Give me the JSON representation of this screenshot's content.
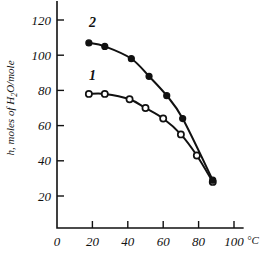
{
  "figure": {
    "background_color": "#ffffff",
    "ink_color": "#111111",
    "style": "line-plot"
  },
  "chart_data": {
    "type": "line",
    "title": "",
    "subtitle": "",
    "xlabel": "°C",
    "ylabel": "h, moles of H₂O/mole",
    "ylabel_parts": {
      "lead": "h, moles of H",
      "subscript": "2",
      "tail": "O/mole"
    },
    "xlim": [
      0,
      105
    ],
    "ylim": [
      0,
      128
    ],
    "xticks": [
      0,
      20,
      40,
      60,
      80,
      100
    ],
    "xticklabels": [
      "0",
      "20",
      "40",
      "60",
      "80",
      "100"
    ],
    "yticks": [
      20,
      40,
      60,
      80,
      100,
      120
    ],
    "yticklabels": [
      "20",
      "40",
      "60",
      "80",
      "100",
      "120"
    ],
    "x_unit_label": "°C",
    "grid": false,
    "legend": "inline-curve-labels",
    "series": [
      {
        "name": "1",
        "label": "1",
        "marker": "open-circle",
        "marker_fill": "#ffffff",
        "marker_edge": "#111111",
        "label_position": {
          "x": 20,
          "y": 86
        },
        "x": [
          18,
          27,
          41,
          50,
          60,
          70,
          79,
          88
        ],
        "values": [
          78,
          78,
          75,
          70,
          64,
          55,
          43,
          28
        ]
      },
      {
        "name": "2",
        "label": "2",
        "marker": "filled-circle",
        "marker_fill": "#111111",
        "marker_edge": "#111111",
        "label_position": {
          "x": 20,
          "y": 116
        },
        "x": [
          18,
          27,
          42,
          52,
          62,
          71,
          88
        ],
        "values": [
          107,
          105,
          98,
          88,
          77,
          64,
          29
        ]
      }
    ]
  }
}
